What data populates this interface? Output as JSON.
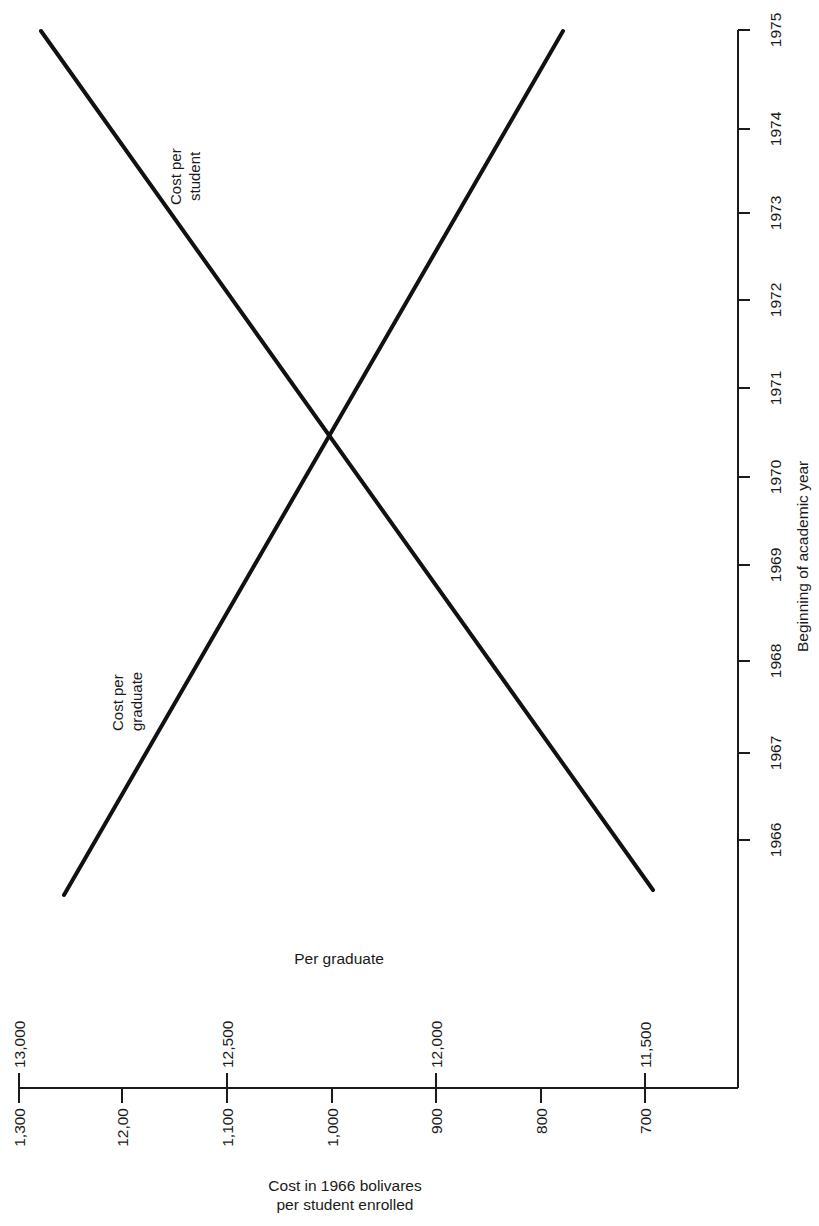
{
  "chart_data": {
    "type": "line",
    "orientation": "rotated-90",
    "title": "",
    "xlabel": "Cost in 1966 bolivares per student enrolled",
    "xlabel_lines": [
      "Cost in 1966 bolivares",
      "per student enrolled"
    ],
    "ylabel": "Beginning of academic year",
    "secondary_axis_label": "Per graduate",
    "year_ticks": [
      "1966",
      "1967",
      "1968",
      "1969",
      "1970",
      "1971",
      "1972",
      "1973",
      "1974",
      "1975"
    ],
    "cost_per_student_ticks": [
      "1,300",
      "12,00",
      "1,100",
      "1,000",
      "900",
      "800",
      "700"
    ],
    "cost_per_graduate_ticks": [
      "13,000",
      "12,500",
      "12,000",
      "11,500"
    ],
    "grid": false,
    "legend": "inline labels",
    "series": [
      {
        "name": "Cost per student",
        "label_lines": [
          "Cost per",
          "student"
        ],
        "axis": "per student enrolled",
        "x": [
          1966,
          1975
        ],
        "values": [
          700,
          1320
        ],
        "note": "rising from ~700 in 1966 to ~1,320 in 1975"
      },
      {
        "name": "Cost per graduate",
        "label_lines": [
          "Cost per",
          "graduate"
        ],
        "axis": "per graduate",
        "x": [
          1966,
          1975
        ],
        "values": [
          12950,
          11650
        ],
        "note": "falling from ~12,950 in 1966 to ~11,650 in 1975"
      }
    ],
    "intersection": {
      "year": 1970.8,
      "cost_per_student": 1000,
      "cost_per_graduate": 12000
    }
  }
}
